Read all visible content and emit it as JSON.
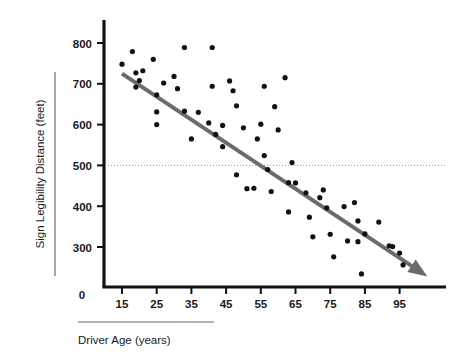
{
  "chart_data": {
    "type": "scatter",
    "title": "",
    "xlabel": "Driver Age (years)",
    "ylabel": "Sign Legibility Distance (feet)",
    "xlim": [
      10,
      103
    ],
    "ylim": [
      200,
      830
    ],
    "grid": false,
    "legend": "none",
    "x_ticks": [
      "15",
      "25",
      "35",
      "45",
      "55",
      "65",
      "75",
      "85",
      "95"
    ],
    "x_tick_values": [
      15,
      25,
      35,
      45,
      55,
      65,
      75,
      85,
      95
    ],
    "y_ticks": [
      "800",
      "700",
      "600",
      "500",
      "400",
      "300"
    ],
    "y_tick_values": [
      800,
      700,
      600,
      500,
      400,
      300
    ],
    "origin_label": "0",
    "series": [
      {
        "name": "Drivers",
        "marker": "circle",
        "color": "#111111",
        "points": [
          [
            15,
            748
          ],
          [
            18,
            779
          ],
          [
            19,
            727
          ],
          [
            19,
            692
          ],
          [
            20,
            708
          ],
          [
            21,
            732
          ],
          [
            24,
            760
          ],
          [
            25,
            673
          ],
          [
            25,
            631
          ],
          [
            25,
            600
          ],
          [
            27,
            702
          ],
          [
            30,
            718
          ],
          [
            31,
            688
          ],
          [
            33,
            789
          ],
          [
            33,
            633
          ],
          [
            35,
            565
          ],
          [
            37,
            630
          ],
          [
            40,
            604
          ],
          [
            41,
            789
          ],
          [
            41,
            694
          ],
          [
            42,
            576
          ],
          [
            44,
            598
          ],
          [
            44,
            546
          ],
          [
            46,
            707
          ],
          [
            47,
            683
          ],
          [
            48,
            646
          ],
          [
            48,
            477
          ],
          [
            50,
            592
          ],
          [
            51,
            443
          ],
          [
            53,
            444
          ],
          [
            54,
            565
          ],
          [
            55,
            601
          ],
          [
            56,
            524
          ],
          [
            56,
            694
          ],
          [
            57,
            490
          ],
          [
            58,
            436
          ],
          [
            59,
            644
          ],
          [
            60,
            587
          ],
          [
            62,
            715
          ],
          [
            63,
            458
          ],
          [
            63,
            386
          ],
          [
            64,
            507
          ],
          [
            65,
            457
          ],
          [
            68,
            433
          ],
          [
            69,
            373
          ],
          [
            70,
            325
          ],
          [
            72,
            421
          ],
          [
            73,
            440
          ],
          [
            74,
            396
          ],
          [
            75,
            331
          ],
          [
            76,
            276
          ],
          [
            79,
            399
          ],
          [
            80,
            315
          ],
          [
            82,
            409
          ],
          [
            83,
            364
          ],
          [
            83,
            313
          ],
          [
            84,
            234
          ],
          [
            85,
            332
          ],
          [
            89,
            361
          ],
          [
            92,
            303
          ],
          [
            93,
            301
          ],
          [
            95,
            285
          ],
          [
            96,
            256
          ]
        ]
      }
    ],
    "trend_line": {
      "name": "fitted regression line",
      "color": "#6b6b6b",
      "width": 4,
      "arrow": true,
      "start": [
        15,
        725
      ],
      "end": [
        103,
        228
      ]
    },
    "reference_line": {
      "name": "500 foot reference",
      "value": 500,
      "style": "dotted",
      "color": "#9a9a9a"
    },
    "axis_color": "#111111"
  }
}
